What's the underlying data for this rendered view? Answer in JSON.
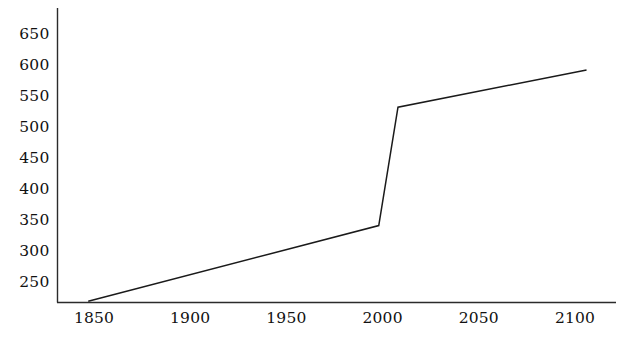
{
  "chart_data": {
    "type": "line",
    "title": "",
    "subtitle": "",
    "xlabel": "",
    "ylabel": "",
    "xlim": [
      1838,
      2117
    ],
    "ylim": [
      218,
      662
    ],
    "xticks": [
      1850,
      1900,
      1950,
      2000,
      2050,
      2100
    ],
    "yticks": [
      250,
      300,
      350,
      400,
      450,
      500,
      550,
      600,
      650
    ],
    "grid": false,
    "legend": false,
    "legend_position": "none",
    "series": [
      {
        "name": "series-1",
        "color": "#1a1a1a",
        "x": [
          1847,
          1998,
          2008,
          2106
        ],
        "values": [
          219,
          341,
          532,
          592
        ]
      }
    ],
    "annotations": []
  },
  "axes": {
    "x_tick_labels": [
      "1850",
      "1900",
      "1950",
      "2000",
      "2050",
      "2100"
    ],
    "y_tick_labels": [
      "250",
      "300",
      "350",
      "400",
      "450",
      "500",
      "550",
      "600",
      "650"
    ]
  },
  "style": {
    "axis_color": "#2b2b2b",
    "line_color": "#1a1a1a",
    "background": "#ffffff",
    "text_color": "#111111"
  }
}
